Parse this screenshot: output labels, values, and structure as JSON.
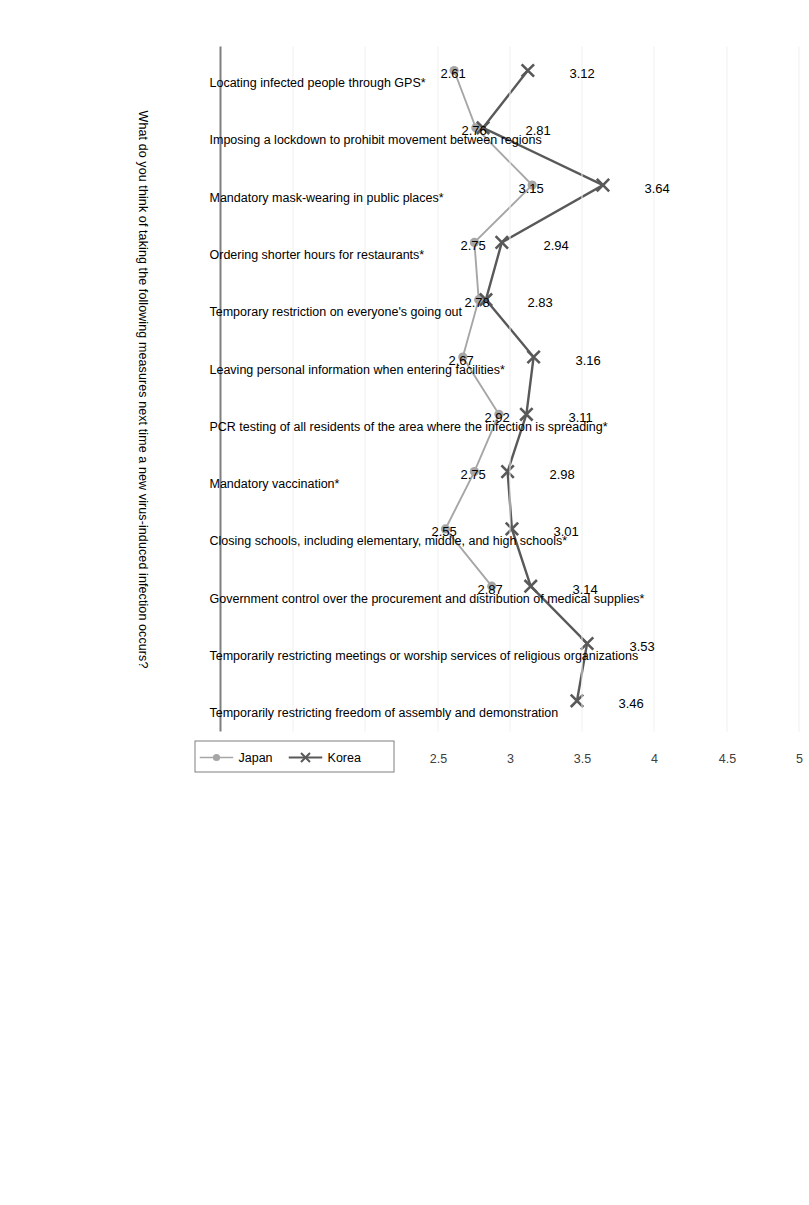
{
  "chart_data": {
    "type": "line",
    "title": "What do you think of taking the following measures next time a new virus-induced infection occurs?",
    "xlabel": "",
    "ylabel": "",
    "ylim": [
      1,
      5
    ],
    "yticks": [
      "1",
      "1.5",
      "2",
      "2.5",
      "3",
      "3.5",
      "4",
      "4.5",
      "5"
    ],
    "grid": true,
    "legend_position": "bottom-right",
    "orientation": "rotated-90",
    "categories": [
      "Locating infected people through GPS*",
      "Imposing a lockdown to prohibit movement between regions",
      "Mandatory mask-wearing in public places*",
      "Ordering shorter hours for restaurants*",
      "Temporary restriction on everyone's going out",
      "Leaving personal information when entering facilities*",
      "PCR testing of all residents of the area where the infection is spreading*",
      "Mandatory vaccination*",
      "Closing schools, including elementary, middle, and high schools*",
      "Government control over the procurement and distribution of medical supplies*",
      "Temporarily restricting meetings or worship services of religious organizations",
      "Temporarily restricting freedom of assembly and demonstration"
    ],
    "series": [
      {
        "name": "Japan",
        "color": "#a6a6a6",
        "marker": "circle",
        "values": [
          2.61,
          2.76,
          3.15,
          2.75,
          2.78,
          2.67,
          2.92,
          2.75,
          2.55,
          2.87,
          null,
          null
        ],
        "labels": [
          "2.61",
          "2.76",
          "3.15",
          "2.75",
          "2.78",
          "2.67",
          "2.92",
          "2.75",
          "2.55",
          "2.87",
          "",
          ""
        ]
      },
      {
        "name": "Korea",
        "color": "#595959",
        "marker": "x",
        "values": [
          3.12,
          2.81,
          3.64,
          2.94,
          2.83,
          3.16,
          3.11,
          2.98,
          3.01,
          3.14,
          3.53,
          3.46
        ],
        "labels": [
          "3.12",
          "2.81",
          "3.64",
          "2.94",
          "2.83",
          "3.16",
          "3.11",
          "2.98",
          "3.01",
          "3.14",
          "3.53",
          "3.46"
        ]
      }
    ]
  },
  "legend": {
    "japan_label": "Japan",
    "korea_label": "Korea"
  }
}
